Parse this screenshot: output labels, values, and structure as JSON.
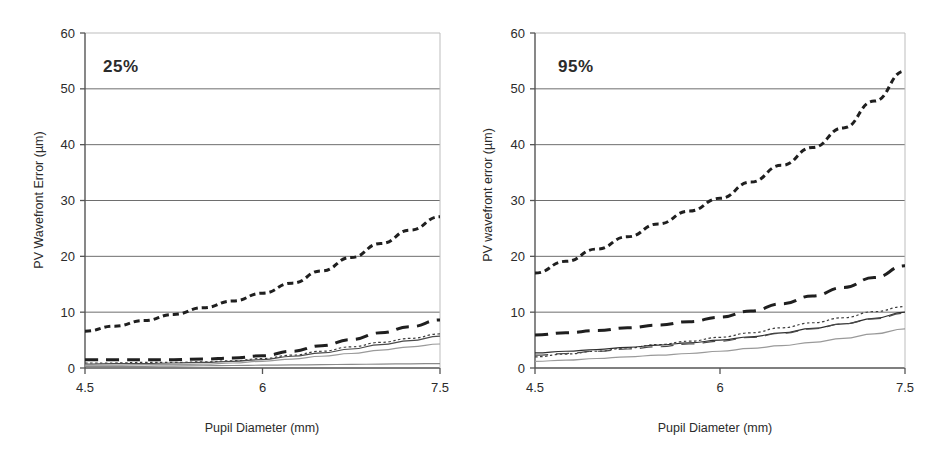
{
  "figure": {
    "panels": [
      {
        "id": "panel-25",
        "tag": "25%",
        "ylabel": "PV Wavefront Error  (µm)",
        "xlabel": "Pupil Diameter (mm)"
      },
      {
        "id": "panel-95",
        "tag": "95%",
        "ylabel": "PV wavefront error (µm)",
        "xlabel": "Pupil Diameter (mm)"
      }
    ]
  },
  "axis": {
    "y_ticks": [
      "0",
      "10",
      "20",
      "30",
      "40",
      "50",
      "60"
    ],
    "x_ticks": [
      "4.5",
      "6",
      "7.5"
    ]
  },
  "colors": {
    "ink": "#2b2b2b",
    "grid": "#6e6e6e",
    "grid_faint": "#bdbdbd",
    "axis": "#555555",
    "series_dark": "#1f1f1f",
    "series_mid": "#3d3d3d",
    "series_light": "#9a9a9a",
    "background": "#ffffff"
  },
  "chart_data": [
    {
      "type": "line",
      "title": "25%",
      "xlabel": "Pupil Diameter (mm)",
      "ylabel": "PV Wavefront Error  (µm)",
      "xlim": [
        4.5,
        7.5
      ],
      "ylim": [
        0,
        60
      ],
      "yticks": [
        0,
        10,
        20,
        30,
        40,
        50,
        60
      ],
      "xticks": [
        4.5,
        6,
        7.5
      ],
      "grid": true,
      "legend": "none",
      "x": [
        4.5,
        4.75,
        5.0,
        5.25,
        5.5,
        5.75,
        6.0,
        6.25,
        6.5,
        6.75,
        7.0,
        7.25,
        7.5
      ],
      "series": [
        {
          "name": "series-1-short-dash-heavy",
          "style": "short-dashed",
          "weight": "heavy",
          "color": "#1f1f1f",
          "values": [
            6.6,
            7.5,
            8.5,
            9.6,
            10.8,
            12.0,
            13.4,
            15.2,
            17.4,
            19.8,
            22.3,
            24.7,
            27.1
          ]
        },
        {
          "name": "series-2-long-dash-heavy",
          "style": "long-dashed",
          "weight": "heavy",
          "color": "#1f1f1f",
          "values": [
            1.5,
            1.5,
            1.5,
            1.5,
            1.6,
            1.8,
            2.2,
            3.0,
            4.0,
            5.1,
            6.3,
            7.4,
            8.6
          ]
        },
        {
          "name": "series-3-dotted-mid",
          "style": "dotted",
          "weight": "light",
          "color": "#3d3d3d",
          "values": [
            0.9,
            0.9,
            1.0,
            1.0,
            1.1,
            1.3,
            1.7,
            2.3,
            3.0,
            3.8,
            4.6,
            5.3,
            6.1
          ]
        },
        {
          "name": "series-4-solid-mid",
          "style": "solid",
          "weight": "light",
          "color": "#4a4a4a",
          "values": [
            0.7,
            0.8,
            0.8,
            0.9,
            1.0,
            1.2,
            1.5,
            2.1,
            2.7,
            3.4,
            4.2,
            4.9,
            5.7
          ]
        },
        {
          "name": "series-5-solid-light",
          "style": "solid",
          "weight": "light",
          "color": "#9a9a9a",
          "values": [
            0.5,
            0.5,
            0.6,
            0.6,
            0.7,
            0.9,
            1.2,
            1.6,
            2.1,
            2.6,
            3.2,
            3.8,
            4.3
          ]
        },
        {
          "name": "series-6-solid-baseline",
          "style": "solid",
          "weight": "light",
          "color": "#8a8a8a",
          "values": [
            0.3,
            0.3,
            0.3,
            0.35,
            0.4,
            0.45,
            0.5,
            0.55,
            0.6,
            0.65,
            0.7,
            0.75,
            0.8
          ]
        }
      ]
    },
    {
      "type": "line",
      "title": "95%",
      "xlabel": "Pupil Diameter (mm)",
      "ylabel": "PV wavefront error (µm)",
      "xlim": [
        4.5,
        7.5
      ],
      "ylim": [
        0,
        60
      ],
      "yticks": [
        0,
        10,
        20,
        30,
        40,
        50,
        60
      ],
      "xticks": [
        4.5,
        6,
        7.5
      ],
      "grid": true,
      "legend": "none",
      "x": [
        4.5,
        4.75,
        5.0,
        5.25,
        5.5,
        5.75,
        6.0,
        6.25,
        6.5,
        6.75,
        7.0,
        7.25,
        7.5
      ],
      "series": [
        {
          "name": "series-1-short-dash-heavy",
          "style": "short-dashed",
          "weight": "heavy",
          "color": "#1f1f1f",
          "values": [
            17.0,
            19.1,
            21.3,
            23.5,
            25.8,
            28.1,
            30.4,
            33.3,
            36.3,
            39.5,
            43.0,
            47.8,
            53.2
          ]
        },
        {
          "name": "series-2-long-dash-heavy",
          "style": "long-dashed",
          "weight": "heavy",
          "color": "#1f1f1f",
          "values": [
            5.9,
            6.3,
            6.7,
            7.2,
            7.7,
            8.3,
            9.1,
            10.2,
            11.5,
            12.9,
            14.4,
            16.2,
            18.3
          ]
        },
        {
          "name": "series-3-dotted-mid",
          "style": "dotted",
          "weight": "light",
          "color": "#3d3d3d",
          "values": [
            2.0,
            2.5,
            3.0,
            3.6,
            4.2,
            4.8,
            5.5,
            6.3,
            7.2,
            8.1,
            9.0,
            10.1,
            11.0
          ]
        },
        {
          "name": "series-4-solid-mid",
          "style": "solid",
          "weight": "light",
          "color": "#2f2f2f",
          "values": [
            2.7,
            3.0,
            3.3,
            3.7,
            4.1,
            4.5,
            5.0,
            5.6,
            6.3,
            7.1,
            7.9,
            8.9,
            10.0
          ]
        },
        {
          "name": "series-5-dash-mid",
          "style": "long-dashed",
          "weight": "light",
          "color": "#4a4a4a",
          "values": [
            2.3,
            2.6,
            3.0,
            3.4,
            3.8,
            4.3,
            4.8,
            5.5,
            6.2,
            7.0,
            7.9,
            8.8,
            9.8
          ]
        },
        {
          "name": "series-6-solid-light",
          "style": "solid",
          "weight": "light",
          "color": "#9a9a9a",
          "values": [
            1.2,
            1.4,
            1.7,
            2.0,
            2.3,
            2.6,
            3.0,
            3.5,
            4.0,
            4.6,
            5.3,
            6.1,
            7.0
          ]
        }
      ]
    }
  ]
}
